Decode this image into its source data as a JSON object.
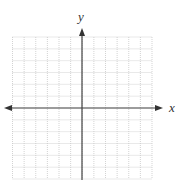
{
  "diagram": {
    "type": "coordinate-grid",
    "x_axis_label": "x",
    "y_axis_label": "y",
    "grid": {
      "columns": 12,
      "rows": 12,
      "columns_left_of_y_axis": 6,
      "rows_above_x_axis": 6,
      "line_style": "dotted",
      "line_color": "#c8c8c8"
    },
    "axis_color": "#444444",
    "arrows": [
      "x-left",
      "x-right",
      "y-up"
    ]
  }
}
